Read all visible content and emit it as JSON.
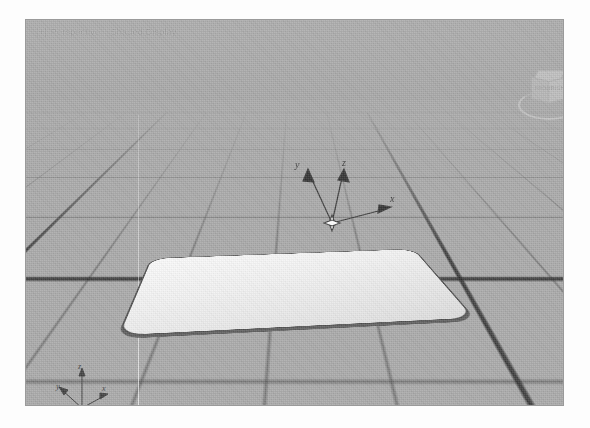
{
  "app": {
    "name": "3d-modeling-viewport",
    "background_color": "#a8a8a8",
    "page_color": "#ffffff"
  },
  "viewport": {
    "title_prefix": "[+]",
    "title_name": "Perspective",
    "title_separator": "|",
    "title_mode": "Shaded Display",
    "border_color": "#9a9a9a",
    "grid_color": "#464646",
    "grid_major_color": "#282828"
  },
  "gizmo": {
    "name": "axis-gizmo",
    "axes": [
      {
        "key": "y",
        "label": "y"
      },
      {
        "key": "z",
        "label": "z"
      },
      {
        "key": "x",
        "label": "x"
      }
    ],
    "origin_marker": "4-point-star",
    "color": "#3a3a3a"
  },
  "world_axis_icon": {
    "name": "world-axis-indicator",
    "axes": [
      {
        "key": "z",
        "label": "z"
      },
      {
        "key": "y",
        "label": "y"
      },
      {
        "key": "x",
        "label": "x"
      }
    ],
    "color": "#3f3f3f"
  },
  "view_cube": {
    "name": "view-cube",
    "top_label": "TOP",
    "left_label": "FRONT",
    "right_label": "RIGHT"
  },
  "object": {
    "name": "rounded-slab",
    "top_color": "#f4f4f4",
    "edge_color": "#4f4f4f",
    "side_color": "#5d5d5d",
    "corner_radius": "26px"
  }
}
